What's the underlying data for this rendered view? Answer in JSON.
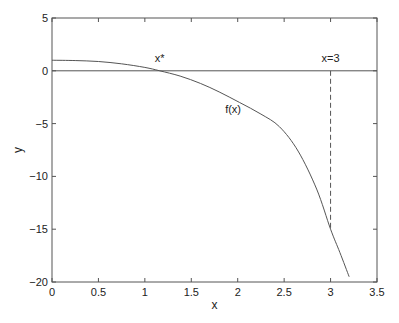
{
  "chart_data": {
    "type": "line",
    "title": "",
    "xlabel": "x",
    "ylabel": "y",
    "xlim": [
      0,
      3.5
    ],
    "ylim": [
      -20,
      5
    ],
    "grid": false,
    "legend": null,
    "x_ticks": [
      0,
      0.5,
      1,
      1.5,
      2,
      2.5,
      3,
      3.5
    ],
    "x_tick_labels": [
      "0",
      "0.5",
      "1",
      "1.5",
      "2",
      "2.5",
      "3",
      "3.5"
    ],
    "y_ticks": [
      -20,
      -15,
      -10,
      -5,
      0,
      5
    ],
    "y_tick_labels": [
      "−20",
      "−15",
      "−10",
      "−5",
      "0",
      "5"
    ],
    "series": [
      {
        "name": "f(x)",
        "style": "solid",
        "x": [
          0,
          0.25,
          0.5,
          0.75,
          1.0,
          1.16,
          1.38,
          1.6,
          1.8,
          2.02,
          2.25,
          2.45,
          2.65,
          2.85,
          3.0,
          3.1,
          3.2
        ],
        "y": [
          1.0,
          0.97,
          0.88,
          0.66,
          0.32,
          0.0,
          -0.5,
          -1.2,
          -2.0,
          -3.0,
          -4.1,
          -5.3,
          -7.6,
          -11.2,
          -15.0,
          -17.2,
          -19.5
        ]
      },
      {
        "name": "y=0",
        "style": "solid",
        "x": [
          0,
          3.5
        ],
        "y": [
          0,
          0
        ]
      },
      {
        "name": "x=3",
        "style": "dashed",
        "x": [
          3,
          3
        ],
        "y": [
          0,
          -15.0
        ]
      }
    ],
    "annotations": [
      {
        "text": "x*",
        "x": 1.16,
        "y": 0.6
      },
      {
        "text": "x=3",
        "x": 3.0,
        "y": 0.6
      },
      {
        "text": "f(x)",
        "x": 1.95,
        "y": -4.2
      }
    ]
  }
}
